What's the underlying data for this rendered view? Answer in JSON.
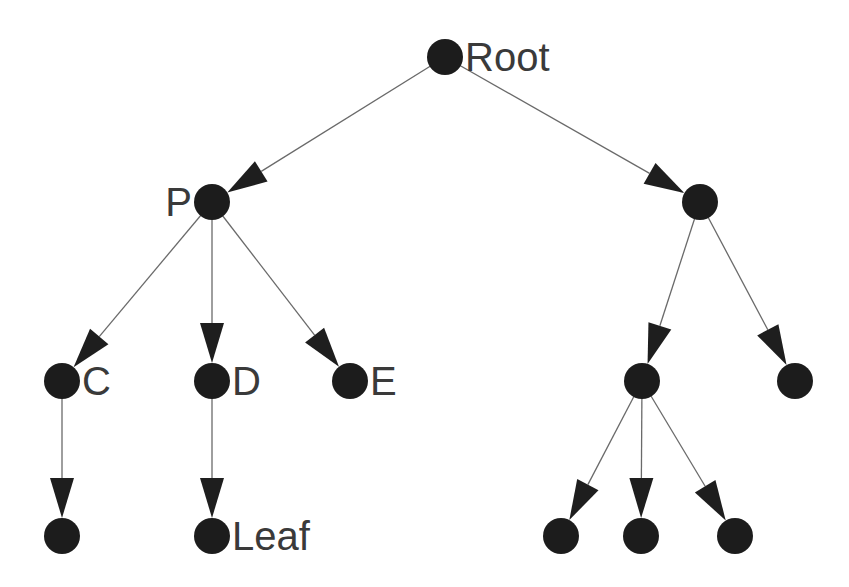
{
  "diagram": {
    "type": "tree",
    "colors": {
      "node": "#1c1c1c",
      "edge": "#6a6a6a",
      "arrow": "#1e1e1e",
      "label": "#3a3a3a",
      "background": "#ffffff"
    },
    "node_radius": 18,
    "nodes": [
      {
        "id": "root",
        "x": 445,
        "y": 57,
        "label": "Root",
        "label_side": "right"
      },
      {
        "id": "p",
        "x": 212,
        "y": 202,
        "label": "P",
        "label_side": "left"
      },
      {
        "id": "r1",
        "x": 700,
        "y": 202,
        "label": ""
      },
      {
        "id": "c",
        "x": 62,
        "y": 381,
        "label": "C",
        "label_side": "right"
      },
      {
        "id": "d",
        "x": 212,
        "y": 381,
        "label": "D",
        "label_side": "right"
      },
      {
        "id": "e",
        "x": 350,
        "y": 381,
        "label": "E",
        "label_side": "right"
      },
      {
        "id": "r2",
        "x": 642,
        "y": 381,
        "label": ""
      },
      {
        "id": "r3",
        "x": 795,
        "y": 381,
        "label": ""
      },
      {
        "id": "c1",
        "x": 62,
        "y": 536,
        "label": ""
      },
      {
        "id": "leaf",
        "x": 212,
        "y": 536,
        "label": "Leaf",
        "label_side": "right"
      },
      {
        "id": "r4",
        "x": 561,
        "y": 536,
        "label": ""
      },
      {
        "id": "r5",
        "x": 641,
        "y": 536,
        "label": ""
      },
      {
        "id": "r6",
        "x": 735,
        "y": 536,
        "label": ""
      }
    ],
    "edges": [
      {
        "from": "root",
        "to": "p"
      },
      {
        "from": "root",
        "to": "r1"
      },
      {
        "from": "p",
        "to": "c"
      },
      {
        "from": "p",
        "to": "d"
      },
      {
        "from": "p",
        "to": "e"
      },
      {
        "from": "r1",
        "to": "r2"
      },
      {
        "from": "r1",
        "to": "r3"
      },
      {
        "from": "c",
        "to": "c1"
      },
      {
        "from": "d",
        "to": "leaf"
      },
      {
        "from": "r2",
        "to": "r4"
      },
      {
        "from": "r2",
        "to": "r5"
      },
      {
        "from": "r2",
        "to": "r6"
      }
    ]
  }
}
